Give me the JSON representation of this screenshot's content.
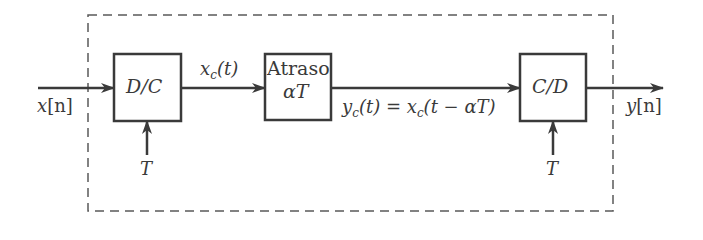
{
  "diagram": {
    "type": "block-diagram",
    "boundary": {
      "style": "dashed",
      "label": ""
    },
    "blocks": [
      {
        "id": "dc",
        "label": "D/C",
        "control_input": "T"
      },
      {
        "id": "delay",
        "label_line1": "Atraso",
        "label_line2": "αT"
      },
      {
        "id": "cd",
        "label": "C/D",
        "control_input": "T"
      }
    ],
    "signals": {
      "input": {
        "name": "x",
        "index": "[n]"
      },
      "xc": {
        "name": "x",
        "sub": "c",
        "arg": "(t)"
      },
      "yc": {
        "lhs_name": "y",
        "lhs_sub": "c",
        "lhs_arg": "(t)",
        "eq": " = ",
        "rhs_name": "x",
        "rhs_sub": "c",
        "rhs_arg": "(t − αT)"
      },
      "output": {
        "name": "y",
        "index": "[n]"
      }
    },
    "edges": [
      {
        "from": "input",
        "to": "dc"
      },
      {
        "from": "dc",
        "to": "delay",
        "label": "x_c(t)"
      },
      {
        "from": "delay",
        "to": "cd",
        "label": "y_c(t) = x_c(t − αT)"
      },
      {
        "from": "cd",
        "to": "output"
      },
      {
        "from": "T",
        "to": "dc"
      },
      {
        "from": "T",
        "to": "cd"
      }
    ],
    "colors": {
      "stroke": "#3a3a3a",
      "dashed": "#5a5a5a",
      "background": "#ffffff"
    }
  }
}
